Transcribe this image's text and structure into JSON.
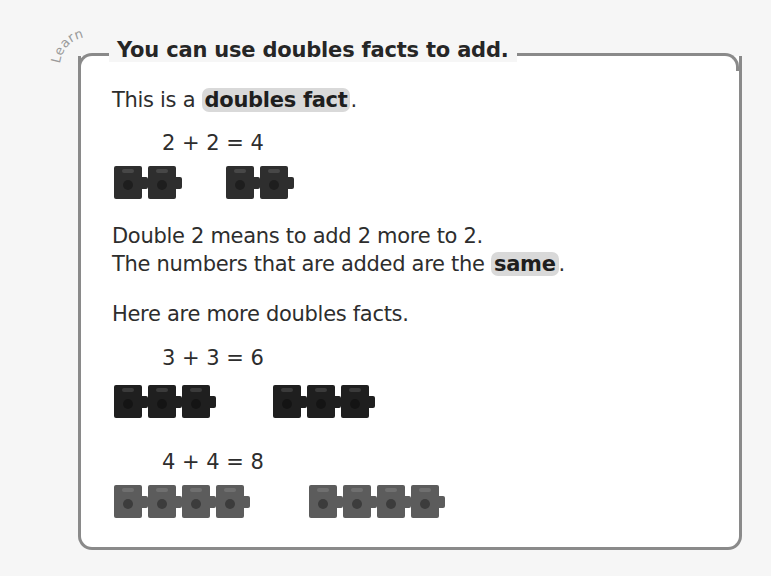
{
  "tag": "Learn",
  "title": "You can use doubles facts to add.",
  "intro": {
    "prefix": "This is a ",
    "highlight": "doubles fact",
    "suffix": "."
  },
  "example": {
    "equation": "2 + 2 = 4",
    "left_count": 2,
    "right_count": 2,
    "cube_color": "#2e2e2e"
  },
  "explanation": {
    "line1": "Double 2 means to add 2 more to 2.",
    "line2_prefix": "The numbers that are added are the ",
    "line2_highlight": "same",
    "line2_suffix": "."
  },
  "more_intro": "Here are more doubles facts.",
  "more_facts": [
    {
      "equation": "3 + 3 = 6",
      "left_count": 3,
      "right_count": 3,
      "cube_color": "#1f1f1f"
    },
    {
      "equation": "4 + 4 = 8",
      "left_count": 4,
      "right_count": 4,
      "cube_color": "#5c5c5c"
    }
  ],
  "colors": {
    "border": "#8a8a8a",
    "highlight_bg": "#d9d9d9",
    "text": "#2d2d2d"
  }
}
